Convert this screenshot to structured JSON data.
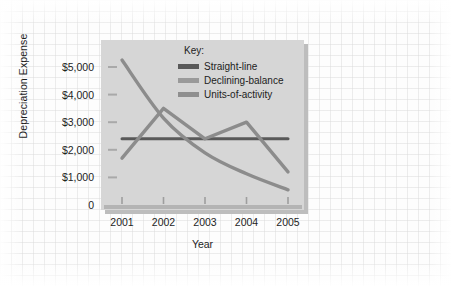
{
  "chart_data": {
    "type": "line",
    "title": "",
    "xlabel": "Year",
    "ylabel": "Depreciation Expense",
    "categories": [
      "2001",
      "2002",
      "2003",
      "2004",
      "2005"
    ],
    "x": [
      2001,
      2002,
      2003,
      2004,
      2005
    ],
    "ylim": [
      0,
      5500
    ],
    "xlim": [
      2000.6,
      2005.4
    ],
    "ytick_labels": [
      "$5,000",
      "$4,000",
      "$3,000",
      "$2,000",
      "$1,000",
      "0"
    ],
    "ytick_values": [
      5000,
      4000,
      3000,
      2000,
      1000,
      0
    ],
    "xtick_labels": [
      "2001",
      "2002",
      "2003",
      "2004",
      "2005"
    ],
    "grid": false,
    "legend_position": "inside-top-right",
    "legend_title": "Key:",
    "series": [
      {
        "name": "Straight-line",
        "color": "#595959",
        "values": [
          2400,
          2400,
          2400,
          2400,
          2400
        ]
      },
      {
        "name": "Declining-balance",
        "color": "#8c8c8c",
        "values": [
          5250,
          3150,
          1890,
          1130,
          550
        ]
      },
      {
        "name": "Units-of-activity",
        "color": "#8c8c8c",
        "values": [
          1700,
          3500,
          2400,
          3000,
          1200
        ]
      }
    ]
  },
  "legend": {
    "title": "Key:",
    "items": [
      {
        "label": "Straight-line",
        "color": "#595959"
      },
      {
        "label": "Declining-balance",
        "color": "#9a9a9a"
      },
      {
        "label": "Units-of-activity",
        "color": "#8f8f8f"
      }
    ]
  },
  "axes": {
    "y_title": "Depreciation Expense",
    "x_title": "Year",
    "y_ticks": [
      "$5,000",
      "$4,000",
      "$3,000",
      "$2,000",
      "$1,000",
      "0"
    ],
    "x_ticks": [
      "2001",
      "2002",
      "2003",
      "2004",
      "2005"
    ]
  },
  "colors": {
    "panel": "#d6d6d6",
    "panel_shadow": "#bdbdbd",
    "axis": "#a9a9a9",
    "straight_line": "#595959",
    "declining_balance": "#959595",
    "units_of_activity": "#8a8a8a",
    "page_background": "#fdfdfd",
    "text": "#1d1d1d"
  }
}
